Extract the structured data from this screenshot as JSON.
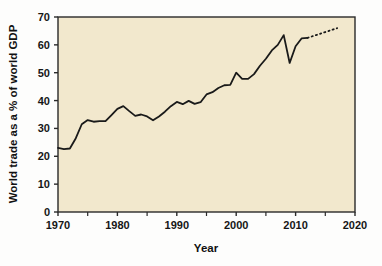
{
  "chart_data": {
    "type": "line",
    "title": "",
    "xlabel": "Year",
    "ylabel": "World trade as a % of world GDP",
    "xlim": [
      1970,
      2020
    ],
    "ylim": [
      0,
      70
    ],
    "xticks": [
      1970,
      1980,
      1990,
      2000,
      2010,
      2020
    ],
    "xticklabels": [
      "1970",
      "1980",
      "1990",
      "2000",
      "2010",
      "2020"
    ],
    "xminorticks": [
      1975,
      1985,
      1995,
      2005,
      2015
    ],
    "yticks": [
      0,
      10,
      20,
      30,
      40,
      50,
      60,
      70
    ],
    "yticklabels": [
      "0",
      "10",
      "20",
      "30",
      "40",
      "50",
      "60",
      "70"
    ],
    "grid": false,
    "legend": false,
    "plot_background": "#f2e8cd",
    "line_color": "#1a1a1a",
    "series": [
      {
        "name": "World trade as a % of world GDP",
        "style": "solid",
        "x": [
          1970,
          1971,
          1972,
          1973,
          1974,
          1975,
          1976,
          1977,
          1978,
          1979,
          1980,
          1981,
          1982,
          1983,
          1984,
          1985,
          1986,
          1987,
          1988,
          1989,
          1990,
          1991,
          1992,
          1993,
          1994,
          1995,
          1996,
          1997,
          1998,
          1999,
          2000,
          2001,
          2002,
          2003,
          2004,
          2005,
          2006,
          2007,
          2008,
          2009,
          2010,
          2011,
          2012
        ],
        "values": [
          23.0,
          22.6,
          22.8,
          26.5,
          31.5,
          33.0,
          32.4,
          32.6,
          32.6,
          34.8,
          37.0,
          38.0,
          36.2,
          34.5,
          35.0,
          34.3,
          32.9,
          34.3,
          36.0,
          38.0,
          39.5,
          38.7,
          39.9,
          38.8,
          39.4,
          42.2,
          43.0,
          44.5,
          45.5,
          45.6,
          50.0,
          47.8,
          47.8,
          49.5,
          52.5,
          55.0,
          58.0,
          60.0,
          63.5,
          53.5,
          59.5,
          62.3,
          62.5
        ]
      },
      {
        "name": "projection",
        "style": "dotted",
        "x": [
          2012,
          2013,
          2014,
          2015,
          2016,
          2017
        ],
        "values": [
          62.5,
          63.2,
          63.9,
          64.6,
          65.3,
          66.0
        ]
      }
    ]
  }
}
